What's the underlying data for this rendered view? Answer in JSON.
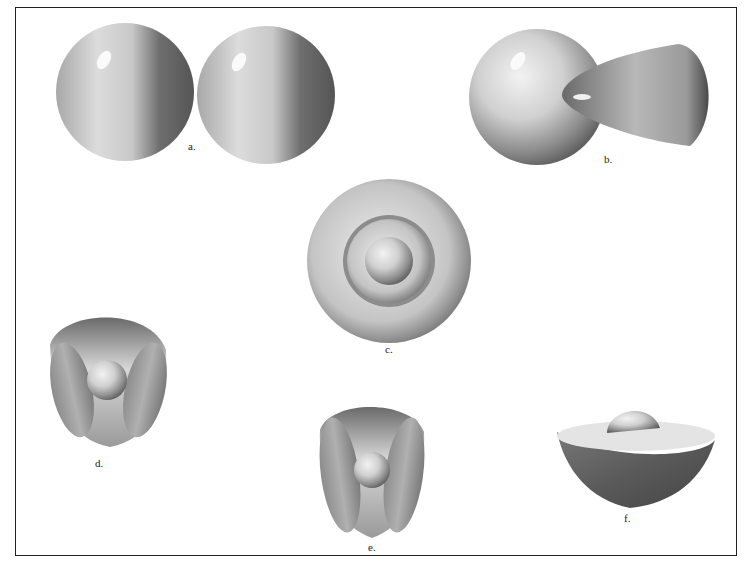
{
  "figure": {
    "panels": [
      {
        "id": "a",
        "label": "a.",
        "shape": "two adjacent spheres"
      },
      {
        "id": "b",
        "label": "b.",
        "shape": "sphere with cone lobe"
      },
      {
        "id": "c",
        "label": "c.",
        "shape": "concentric spherical shells"
      },
      {
        "id": "d",
        "label": "d.",
        "shape": "rounded tetrahedral shell with cutaways and central sphere"
      },
      {
        "id": "e",
        "label": "e.",
        "shape": "elongated rounded shell with cutaways and central sphere"
      },
      {
        "id": "f",
        "label": "f.",
        "shape": "hemispherical bowl with dome on top"
      }
    ]
  },
  "colors": {
    "frame": "#222222",
    "background": "#ffffff",
    "shade_dark": "#5a5a5a",
    "shade_light": "#e8e8e8"
  }
}
